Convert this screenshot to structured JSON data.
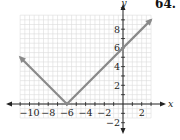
{
  "problem_number": "64.",
  "chart_data": {
    "type": "line",
    "title": "",
    "function": "y = |x + 6|",
    "xlabel": "x",
    "ylabel": "y",
    "xlim": [
      -11,
      3
    ],
    "ylim": [
      -1.5,
      9.5
    ],
    "x_ticks": [
      -10,
      -8,
      -6,
      -4,
      -2,
      2
    ],
    "y_ticks": [
      -2,
      2,
      4,
      6,
      8
    ],
    "grid": true,
    "series": [
      {
        "name": "graph",
        "x": [
          -11,
          -6,
          3
        ],
        "y": [
          5,
          0,
          9
        ],
        "arrows": "both-ends",
        "color": "#8a8a8a"
      }
    ],
    "vertex": [
      -6,
      0
    ]
  },
  "colors": {
    "grid": "#dcdcdc",
    "axis": "#222222",
    "line": "#8a8a8a"
  }
}
